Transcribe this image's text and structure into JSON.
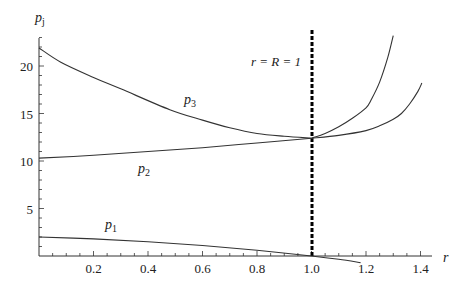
{
  "chart_data": {
    "type": "line",
    "title": "",
    "xlabel": "r",
    "ylabel": "p_j",
    "xlim": [
      0,
      1.42
    ],
    "ylim": [
      0,
      23.3
    ],
    "grid": false,
    "legend": "none (inline curve labels)",
    "x_ticks": [
      0.2,
      0.4,
      0.6,
      0.8,
      1.0,
      1.2,
      1.4
    ],
    "x_tick_labels": [
      "0.2",
      "0.4",
      "0.6",
      "0.8",
      "1.0",
      "1.2",
      "1.4"
    ],
    "y_ticks": [
      5,
      10,
      15,
      20
    ],
    "y_tick_labels": [
      "5",
      "10",
      "15",
      "20"
    ],
    "series": [
      {
        "name": "p3 (left branch)",
        "label": "p",
        "subscript": "3",
        "x": [
          0.0,
          0.08,
          0.2,
          0.3,
          0.48,
          0.6,
          0.7,
          0.8,
          0.9,
          1.0
        ],
        "y": [
          21.9,
          20.4,
          18.8,
          17.6,
          15.4,
          14.3,
          13.5,
          12.9,
          12.6,
          12.4
        ]
      },
      {
        "name": "p2 (left branch)",
        "label": "p",
        "subscript": "2",
        "x": [
          0.0,
          0.2,
          0.4,
          0.6,
          0.8,
          1.0
        ],
        "y": [
          10.3,
          10.6,
          11.0,
          11.4,
          11.9,
          12.4
        ]
      },
      {
        "name": "p3 continuation (r > 1)",
        "x": [
          1.0,
          1.05,
          1.1,
          1.15,
          1.2,
          1.22,
          1.25,
          1.28,
          1.3
        ],
        "y": [
          12.4,
          12.9,
          13.6,
          14.5,
          15.6,
          16.5,
          18.3,
          20.9,
          23.2
        ]
      },
      {
        "name": "p2 continuation (r > 1)",
        "x": [
          1.0,
          1.1,
          1.2,
          1.25,
          1.3,
          1.33,
          1.36,
          1.39,
          1.405
        ],
        "y": [
          12.4,
          12.7,
          13.2,
          13.7,
          14.4,
          15.0,
          16.0,
          17.3,
          18.2
        ]
      },
      {
        "name": "p1",
        "label": "p",
        "subscript": "1",
        "x": [
          0.0,
          0.2,
          0.4,
          0.6,
          0.8,
          1.0,
          1.1,
          1.18
        ],
        "y": [
          2.0,
          1.8,
          1.5,
          1.1,
          0.6,
          0.0,
          -0.35,
          -0.7
        ]
      }
    ],
    "annotations": [
      {
        "type": "vline",
        "x": 1.0,
        "style": "dashed",
        "label": "r = R = 1"
      }
    ],
    "labels": {
      "p3": {
        "x": 0.55,
        "y": 16.3
      },
      "p2": {
        "x": 0.37,
        "y": 8.2
      },
      "p1": {
        "x": 0.25,
        "y": 2.8
      }
    }
  },
  "axes": {
    "x_label": "r",
    "y_label": "p",
    "y_label_sub": "j"
  },
  "annotation_text": "r = R = 1",
  "curve_labels": {
    "p1_main": "p",
    "p1_sub": "1",
    "p2_main": "p",
    "p2_sub": "2",
    "p3_main": "p",
    "p3_sub": "3"
  }
}
